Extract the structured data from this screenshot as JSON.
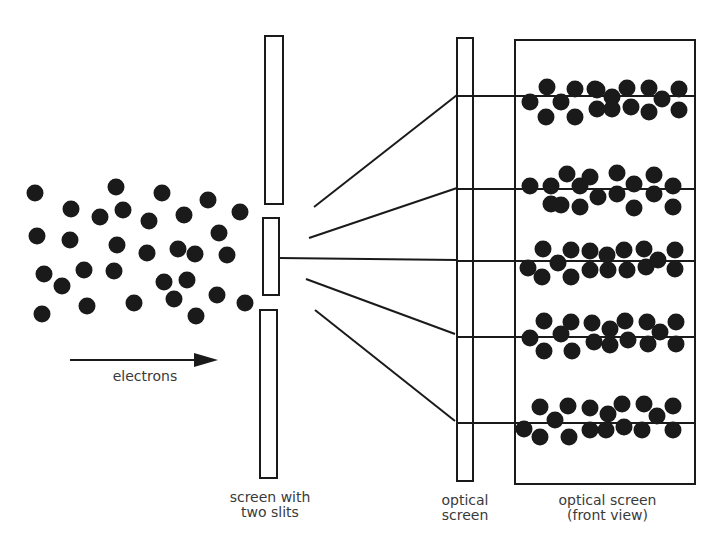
{
  "colors": {
    "ink": "#1a1a1a",
    "label": "#3a3a3a",
    "background": "#ffffff"
  },
  "labels": {
    "electrons": "electrons",
    "slit_screen_line1": "screen with",
    "slit_screen_line2": "two slits",
    "optical_screen_line1": "optical",
    "optical_screen_line2": "screen",
    "front_view_line1": "optical screen",
    "front_view_line2": "(front view)"
  },
  "diagram": {
    "electron_radius": 8.5,
    "electrons": [
      [
        35,
        193
      ],
      [
        71,
        209
      ],
      [
        100,
        217
      ],
      [
        116,
        187
      ],
      [
        123,
        210
      ],
      [
        149,
        221
      ],
      [
        162,
        193
      ],
      [
        184,
        215
      ],
      [
        208,
        200
      ],
      [
        240,
        212
      ],
      [
        37,
        236
      ],
      [
        70,
        240
      ],
      [
        117,
        245
      ],
      [
        147,
        253
      ],
      [
        178,
        249
      ],
      [
        195,
        254
      ],
      [
        219,
        233
      ],
      [
        227,
        255
      ],
      [
        44,
        274
      ],
      [
        62,
        286
      ],
      [
        84,
        270
      ],
      [
        114,
        271
      ],
      [
        164,
        282
      ],
      [
        187,
        280
      ],
      [
        217,
        295
      ],
      [
        42,
        314
      ],
      [
        87,
        306
      ],
      [
        134,
        303
      ],
      [
        174,
        299
      ],
      [
        196,
        316
      ],
      [
        245,
        303
      ]
    ],
    "slit_screen": {
      "bars": [
        {
          "x": 265,
          "y": 36,
          "w": 18,
          "h": 168
        },
        {
          "x": 263,
          "y": 218,
          "w": 16,
          "h": 77
        },
        {
          "x": 260,
          "y": 310,
          "w": 17,
          "h": 168
        }
      ]
    },
    "optical_screen_side": {
      "x": 457,
      "y": 38,
      "w": 16,
      "h": 443
    },
    "front_view": {
      "x": 515,
      "y": 40,
      "w": 180,
      "h": 444
    },
    "rays": [
      {
        "from": [
          314,
          207
        ],
        "to": [
          457,
          95
        ]
      },
      {
        "from": [
          309,
          238
        ],
        "to": [
          457,
          188
        ]
      },
      {
        "from": [
          279,
          258
        ],
        "to": [
          457,
          260
        ]
      },
      {
        "from": [
          306,
          279
        ],
        "to": [
          455,
          334
        ]
      },
      {
        "from": [
          315,
          310
        ],
        "to": [
          455,
          421
        ]
      }
    ],
    "band_lines_y": [
      96,
      189,
      261,
      337,
      423
    ],
    "bands": [
      {
        "dots": [
          [
            530,
            102
          ],
          [
            547,
            87
          ],
          [
            546,
            117
          ],
          [
            561,
            102
          ],
          [
            575,
            89
          ],
          [
            575,
            117
          ],
          [
            595,
            89
          ],
          [
            597,
            109
          ],
          [
            612,
            97
          ],
          [
            627,
            88
          ],
          [
            631,
            107
          ],
          [
            649,
            88
          ],
          [
            649,
            112
          ],
          [
            662,
            99
          ],
          [
            679,
            89
          ],
          [
            679,
            110
          ],
          [
            612,
            109
          ],
          [
            597,
            90
          ]
        ]
      },
      {
        "dots": [
          [
            530,
            186
          ],
          [
            551,
            204
          ],
          [
            551,
            186
          ],
          [
            567,
            174
          ],
          [
            561,
            205
          ],
          [
            580,
            186
          ],
          [
            590,
            177
          ],
          [
            580,
            207
          ],
          [
            598,
            197
          ],
          [
            617,
            173
          ],
          [
            617,
            194
          ],
          [
            634,
            184
          ],
          [
            634,
            208
          ],
          [
            654,
            175
          ],
          [
            654,
            194
          ],
          [
            673,
            186
          ],
          [
            673,
            207
          ]
        ]
      },
      {
        "dots": [
          [
            528,
            268
          ],
          [
            542,
            277
          ],
          [
            543,
            249
          ],
          [
            558,
            263
          ],
          [
            571,
            250
          ],
          [
            571,
            277
          ],
          [
            590,
            251
          ],
          [
            590,
            270
          ],
          [
            607,
            255
          ],
          [
            608,
            270
          ],
          [
            624,
            250
          ],
          [
            627,
            270
          ],
          [
            644,
            249
          ],
          [
            646,
            267
          ],
          [
            658,
            260
          ],
          [
            675,
            250
          ],
          [
            675,
            269
          ]
        ]
      },
      {
        "dots": [
          [
            530,
            338
          ],
          [
            544,
            351
          ],
          [
            544,
            321
          ],
          [
            561,
            334
          ],
          [
            571,
            322
          ],
          [
            572,
            351
          ],
          [
            592,
            323
          ],
          [
            594,
            342
          ],
          [
            610,
            329
          ],
          [
            610,
            345
          ],
          [
            625,
            321
          ],
          [
            628,
            340
          ],
          [
            647,
            322
          ],
          [
            648,
            344
          ],
          [
            660,
            332
          ],
          [
            676,
            322
          ],
          [
            676,
            344
          ]
        ]
      },
      {
        "dots": [
          [
            524,
            429
          ],
          [
            540,
            437
          ],
          [
            540,
            407
          ],
          [
            555,
            420
          ],
          [
            568,
            406
          ],
          [
            569,
            437
          ],
          [
            590,
            408
          ],
          [
            590,
            430
          ],
          [
            608,
            414
          ],
          [
            606,
            430
          ],
          [
            622,
            404
          ],
          [
            624,
            427
          ],
          [
            644,
            404
          ],
          [
            642,
            430
          ],
          [
            657,
            416
          ],
          [
            673,
            406
          ],
          [
            673,
            430
          ]
        ]
      }
    ],
    "electron_arrow": {
      "x1": 70,
      "y1": 360,
      "x2": 218,
      "y2": 360
    }
  }
}
